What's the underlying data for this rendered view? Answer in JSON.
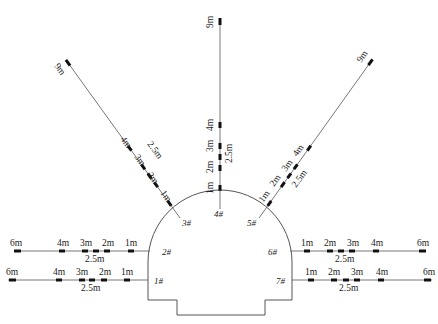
{
  "diagram": {
    "colors": {
      "line": "#555555",
      "anchor": "#111111",
      "text": "#222222",
      "background": "#ffffff"
    },
    "points": [
      {
        "id": "1#",
        "label": "1#"
      },
      {
        "id": "2#",
        "label": "2#"
      },
      {
        "id": "3#",
        "label": "3#"
      },
      {
        "id": "4#",
        "label": "4#"
      },
      {
        "id": "5#",
        "label": "5#"
      },
      {
        "id": "6#",
        "label": "6#"
      },
      {
        "id": "7#",
        "label": "7#"
      }
    ],
    "boreholes": {
      "p1": {
        "labels": [
          "1m",
          "2m",
          "3m",
          "4m",
          "6m"
        ],
        "extra": "2.5m"
      },
      "p2": {
        "labels": [
          "1m",
          "2m",
          "3m",
          "4m",
          "6m"
        ],
        "extra": "2.5m"
      },
      "p3": {
        "labels": [
          "1m",
          "2m",
          "3m",
          "4m",
          "9m"
        ],
        "extra": "2.5m"
      },
      "p4": {
        "labels": [
          "1m",
          "2m",
          "3m",
          "4m",
          "9m"
        ],
        "extra": "2.5m"
      },
      "p5": {
        "labels": [
          "1m",
          "2m",
          "3m",
          "4m",
          "9m"
        ],
        "extra": "2.5m"
      },
      "p6": {
        "labels": [
          "1m",
          "2m",
          "3m",
          "4m",
          "6m"
        ],
        "extra": "2.5m"
      },
      "p7": {
        "labels": [
          "1m",
          "2m",
          "3m",
          "4m",
          "6m"
        ],
        "extra": "2.5m"
      }
    }
  }
}
